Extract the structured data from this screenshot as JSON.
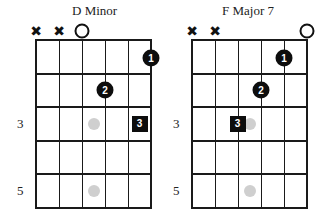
{
  "chords": [
    {
      "name": "D Minor",
      "left": 36,
      "title_x": 72,
      "string_marks": [
        {
          "string": 0,
          "type": "muted",
          "glyph": "✖"
        },
        {
          "string": 1,
          "type": "muted",
          "glyph": "✖"
        },
        {
          "string": 2,
          "type": "open"
        }
      ],
      "fingers": [
        {
          "label": "1",
          "string": 5,
          "fret": 1,
          "shape": "circle"
        },
        {
          "label": "2",
          "string": 3,
          "fret": 2,
          "shape": "circle"
        },
        {
          "label": "3",
          "string": 4,
          "fret": 3,
          "shape": "square"
        }
      ],
      "markers": [
        {
          "string": 2.5,
          "fret": 3
        },
        {
          "string": 2.5,
          "fret": 5
        }
      ],
      "fret_labels": [
        {
          "fret": 3,
          "label": "3"
        },
        {
          "fret": 5,
          "label": "5"
        }
      ]
    },
    {
      "name": "F Major 7",
      "left": 192,
      "title_x": 222,
      "string_marks": [
        {
          "string": 0,
          "type": "muted",
          "glyph": "✖"
        },
        {
          "string": 1,
          "type": "muted",
          "glyph": "✖"
        },
        {
          "string": 5,
          "type": "open"
        }
      ],
      "fingers": [
        {
          "label": "1",
          "string": 4,
          "fret": 1,
          "shape": "circle"
        },
        {
          "label": "2",
          "string": 3,
          "fret": 2,
          "shape": "circle"
        },
        {
          "label": "3",
          "string": 2,
          "fret": 3,
          "shape": "square"
        }
      ],
      "markers": [
        {
          "string": 2.5,
          "fret": 3
        },
        {
          "string": 2.5,
          "fret": 5
        }
      ],
      "fret_labels": [
        {
          "fret": 3,
          "label": "3"
        },
        {
          "fret": 5,
          "label": "5"
        }
      ]
    }
  ],
  "grid": {
    "top": 40,
    "string_spacing": 23,
    "fret_spacing": 33.5,
    "strings": 6,
    "frets": 5
  }
}
